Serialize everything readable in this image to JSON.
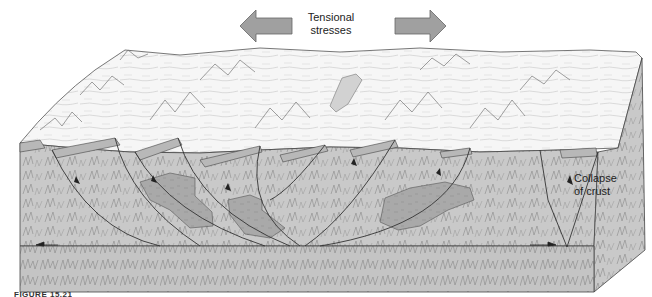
{
  "figure": {
    "type": "geologic block diagram",
    "labels": {
      "stress": "Tensional stresses",
      "stress_line1": "Tensional",
      "stress_line2": "stresses",
      "collapse_line1": "Collapse",
      "collapse_line2": "of crust"
    },
    "caption": "FIGURE 15.21"
  },
  "colors": {
    "surface": "#f4f4f4",
    "block_fill": "#c9c9c9",
    "basement_fill": "#c4c4c4",
    "magma_fill": "#a8a8a8",
    "stratum_band": "#b5b5b5",
    "arrow_fill": "#a0a0a0",
    "line": "#333333"
  }
}
